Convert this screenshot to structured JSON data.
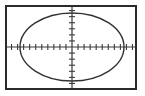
{
  "figure": {
    "kind": "graphing-calculator-screen",
    "background_color": "#ffffff",
    "frame_color": "#2b2b2b",
    "axis_color": "#3a3a3a",
    "curve_color": "#333333",
    "frame": {
      "x": 6,
      "y": 6,
      "width": 130,
      "height": 83,
      "stroke_width": 2
    }
  },
  "chart_data": {
    "type": "line",
    "title": "",
    "subtitle": "",
    "xlabel": "",
    "ylabel": "",
    "grid": false,
    "legend": null,
    "legend_position": "none",
    "annotations": [],
    "axes": {
      "origin_px": {
        "x": 72,
        "y": 47
      },
      "xlim": [
        -11,
        11
      ],
      "ylim": [
        -7,
        7
      ],
      "x_tick_step": 1,
      "y_tick_step": 1,
      "x_tick_labels": [],
      "y_tick_labels": [],
      "x_tick_count": 22,
      "y_tick_count": 14,
      "tick_length_px": 3,
      "x_axis_visible": true,
      "y_axis_visible": true
    },
    "series": [
      {
        "name": "ellipse",
        "shape": "ellipse",
        "center": [
          0,
          0
        ],
        "semi_axis_x": 8.6,
        "semi_axis_y": 5.6,
        "center_px": [
          72,
          47
        ],
        "radius_x_px": 52,
        "radius_y_px": 34,
        "equation": "x^2/8.6^2 + y^2/5.6^2 = 1",
        "closed": true,
        "stroke_width": 1.4
      }
    ]
  }
}
